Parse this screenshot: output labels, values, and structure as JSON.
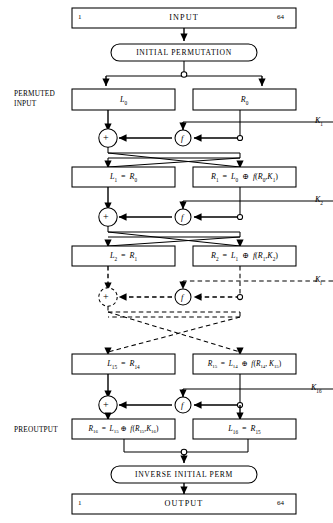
{
  "figure": {
    "type": "des-feistel-network",
    "stroke_color": "#000000",
    "fill_color": "#ffffff"
  },
  "side_labels": {
    "permuted_input_line1": "PERMUTED",
    "permuted_input_line2": "INPUT",
    "preoutput": "PREOUTPUT"
  },
  "io": {
    "input_label": "INPUT",
    "output_label": "OUTPUT",
    "bit_first": "1",
    "bit_last": "64"
  },
  "permutations": {
    "initial": "INITIAL PERMUTATION",
    "inverse": "INVERSE INITIAL PERM"
  },
  "nodes": {
    "xor_symbol": "+",
    "f_symbol": "f"
  },
  "keys": [
    {
      "name": "key-1",
      "base": "K",
      "sub": "1"
    },
    {
      "name": "key-2",
      "base": "K",
      "sub": "2"
    },
    {
      "name": "key-i",
      "base": "K",
      "sub": "i"
    },
    {
      "name": "key-16",
      "base": "K",
      "sub": "16"
    }
  ],
  "registers": {
    "r0_left": {
      "base": "L",
      "sub": "0"
    },
    "r0_right": {
      "base": "R",
      "sub": "0"
    },
    "round1_left": {
      "lhs_base": "L",
      "lhs_sub": "1",
      "eq": "=",
      "rhs_base": "R",
      "rhs_sub": "0"
    },
    "round1_right": {
      "lhs_base": "R",
      "lhs_sub": "1",
      "eq": "=",
      "t1_base": "L",
      "t1_sub": "0",
      "op": "⊕",
      "fn": "f",
      "arg1_base": "R",
      "arg1_sub": "0",
      "arg2_base": "K",
      "arg2_sub": "1"
    },
    "round2_left": {
      "lhs_base": "L",
      "lhs_sub": "2",
      "eq": "=",
      "rhs_base": "R",
      "rhs_sub": "1"
    },
    "round2_right": {
      "lhs_base": "R",
      "lhs_sub": "2",
      "eq": "=",
      "t1_base": "L",
      "t1_sub": "1",
      "op": "⊕",
      "fn": "f",
      "arg1_base": "R",
      "arg1_sub": "1",
      "arg2_base": "K",
      "arg2_sub": "2"
    },
    "round15_left": {
      "lhs_base": "L",
      "lhs_sub": "15",
      "eq": "=",
      "rhs_base": "R",
      "rhs_sub": "14"
    },
    "round15_right": {
      "lhs_base": "R",
      "lhs_sub": "15",
      "eq": "=",
      "t1_base": "L",
      "t1_sub": "14",
      "op": "⊕",
      "fn": "f",
      "arg1_base": "R",
      "arg1_sub": "14",
      "arg2_base": "K",
      "arg2_sub": "15"
    },
    "preoutput_left": {
      "lhs_base": "R",
      "lhs_sub": "16",
      "eq": "=",
      "t1_base": "L",
      "t1_sub": "15",
      "op": "⊕",
      "fn": "f",
      "arg1_base": "R",
      "arg1_sub": "15",
      "arg2_base": "K",
      "arg2_sub": "16"
    },
    "preoutput_right": {
      "lhs_base": "L",
      "lhs_sub": "16",
      "eq": "=",
      "rhs_base": "R",
      "rhs_sub": "15"
    }
  }
}
